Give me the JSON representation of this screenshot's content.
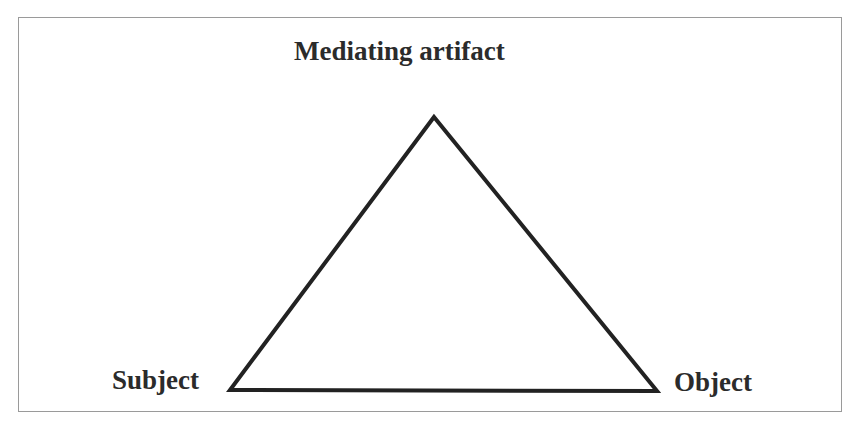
{
  "diagram": {
    "type": "triangle",
    "nodes": {
      "top": {
        "label": "Mediating artifact"
      },
      "left": {
        "label": "Subject"
      },
      "right": {
        "label": "Object"
      }
    },
    "edges": [
      {
        "from": "Subject",
        "to": "Mediating artifact"
      },
      {
        "from": "Mediating artifact",
        "to": "Object"
      },
      {
        "from": "Subject",
        "to": "Object"
      }
    ],
    "colors": {
      "line": "#222222",
      "text": "#2b2b2b",
      "border": "#9a9a9a",
      "background": "#ffffff"
    }
  }
}
